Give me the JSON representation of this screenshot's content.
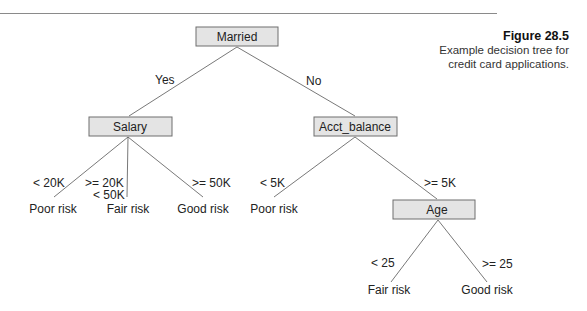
{
  "figure": {
    "label": "Figure 28.5",
    "caption_line1": "Example decision tree for",
    "caption_line2": "credit card applications."
  },
  "tree": {
    "root": {
      "label": "Married"
    },
    "edges_root": {
      "yes": "Yes",
      "no": "No"
    },
    "salary": {
      "label": "Salary",
      "branches": [
        {
          "cond": "< 20K",
          "leaf": "Poor risk"
        },
        {
          "cond_line1": ">= 20K",
          "cond_line2": "< 50K",
          "leaf": "Fair risk"
        },
        {
          "cond": ">= 50K",
          "leaf": "Good risk"
        }
      ]
    },
    "acct_balance": {
      "label": "Acct_balance",
      "branches": [
        {
          "cond": "< 5K",
          "leaf": "Poor risk"
        },
        {
          "cond": ">= 5K"
        }
      ]
    },
    "age": {
      "label": "Age",
      "branches": [
        {
          "cond": "< 25",
          "leaf": "Fair risk"
        },
        {
          "cond": ">= 25",
          "leaf": "Good risk"
        }
      ]
    }
  },
  "colors": {
    "node_fill": "#e4e4e4",
    "node_stroke": "#6e6e6e",
    "edge": "#555555"
  }
}
